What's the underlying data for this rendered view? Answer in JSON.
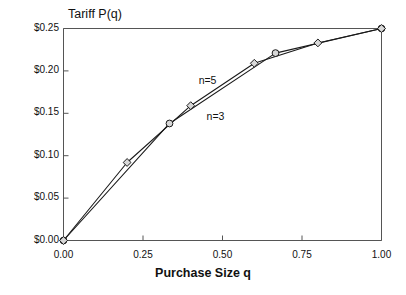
{
  "chart_data": {
    "type": "line",
    "title": "Tariff P(q)",
    "xlabel": "Purchase Size q",
    "ylabel": "",
    "xlim": [
      0.0,
      1.0
    ],
    "ylim": [
      0.0,
      0.25
    ],
    "grid": false,
    "legend_position": "inline-annotations",
    "x_ticks": [
      0.0,
      0.25,
      0.5,
      0.75,
      1.0
    ],
    "x_tick_labels": [
      "0.00",
      "0.25",
      "0.50",
      "0.75",
      "1.00"
    ],
    "y_ticks": [
      0.0,
      0.05,
      0.1,
      0.15,
      0.2,
      0.25
    ],
    "y_tick_labels": [
      "$0.00",
      "$0.05",
      "$0.10",
      "$0.15",
      "$0.20",
      "$0.25"
    ],
    "series": [
      {
        "name": "n=3",
        "marker": "circle",
        "x": [
          0.0,
          0.3333,
          0.6667,
          1.0
        ],
        "y": [
          0.0,
          0.138,
          0.221,
          0.25
        ]
      },
      {
        "name": "n=5",
        "marker": "diamond",
        "x": [
          0.0,
          0.2,
          0.4,
          0.6,
          0.8,
          1.0
        ],
        "y": [
          0.0,
          0.092,
          0.159,
          0.209,
          0.233,
          0.25
        ]
      }
    ],
    "annotations": [
      {
        "text": "n=5",
        "x": 0.425,
        "y": 0.1885
      },
      {
        "text": "n=3",
        "x": 0.45,
        "y": 0.1455
      }
    ]
  },
  "style": {
    "axis_color": "#555555",
    "line_color": "#1a1a1a",
    "marker_fill": "#d8d8d8",
    "marker_edge": "#1a1a1a",
    "background": "#ffffff"
  }
}
